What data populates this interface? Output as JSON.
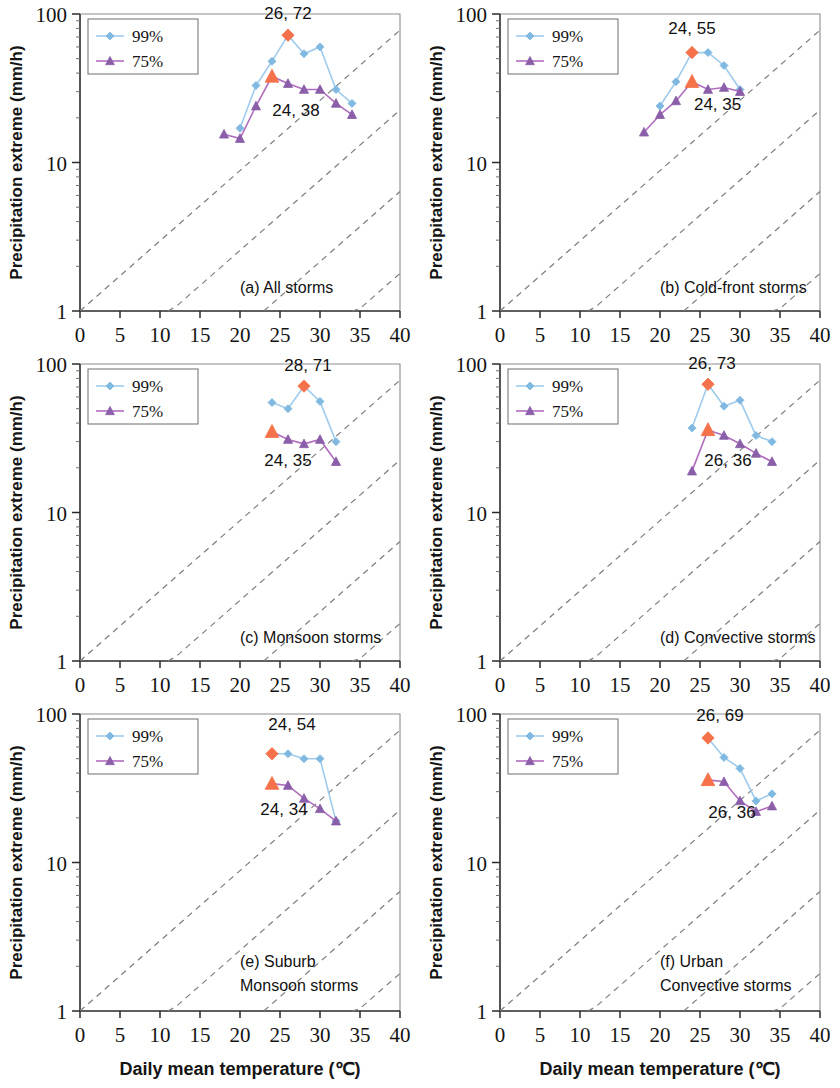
{
  "figure": {
    "n_panels": 6,
    "shared_xlabel": "Daily mean temperature (℃)",
    "shared_ylabel": "Precipitation extreme (mm/h)",
    "legend_labels": [
      "99%",
      "75%"
    ],
    "colors": {
      "series_99": "#7fb8e0",
      "series_99_line": "#9ecbec",
      "series_75": "#8a5ea8",
      "series_75_line": "#b06cbe",
      "highlight": "#f4714a",
      "cc_dashed": "#7d7d7d",
      "axis": "#2b2b2b"
    },
    "x_ticks": [
      0,
      5,
      10,
      15,
      20,
      25,
      30,
      35,
      40
    ],
    "y_ticks": [
      1,
      10,
      100
    ],
    "xlim": [
      0,
      40
    ],
    "ylim": [
      1,
      100
    ],
    "yscale": "log"
  },
  "chart_data": [
    {
      "id": "a",
      "type": "line",
      "title": "(a) All storms",
      "caption_lines": [
        "(a) All storms"
      ],
      "xlabel": "Daily mean temperature (℃)",
      "ylabel": "Precipitation extreme (mm/h)",
      "xlim": [
        0,
        40
      ],
      "ylim": [
        1,
        100
      ],
      "yscale": "log",
      "grid": false,
      "legend_position": "top-left",
      "series": [
        {
          "name": "99%",
          "marker": "diamond",
          "color": "#7fb8e0",
          "x": [
            20,
            22,
            24,
            26,
            28,
            30,
            32,
            34
          ],
          "values": [
            17,
            33,
            48,
            72,
            54,
            60,
            31,
            25
          ]
        },
        {
          "name": "75%",
          "marker": "triangle",
          "color": "#8a5ea8",
          "x": [
            18,
            20,
            22,
            24,
            26,
            28,
            30,
            32,
            34
          ],
          "values": [
            15.5,
            14.5,
            24,
            38,
            34,
            31,
            31,
            25,
            21
          ]
        }
      ],
      "highlights": [
        {
          "series": "99%",
          "x": 26,
          "y": 72,
          "label": "26, 72",
          "label_x": 26,
          "label_y": 92
        },
        {
          "series": "75%",
          "x": 24,
          "y": 38,
          "label": "24, 38",
          "label_x": 27.0,
          "label_y": 20.5
        }
      ]
    },
    {
      "id": "b",
      "type": "line",
      "title": "(b) Cold-front storms",
      "caption_lines": [
        "(b) Cold-front storms"
      ],
      "xlabel": "Daily mean temperature (℃)",
      "ylabel": "Precipitation extreme (mm/h)",
      "xlim": [
        0,
        40
      ],
      "ylim": [
        1,
        100
      ],
      "yscale": "log",
      "grid": false,
      "legend_position": "top-left",
      "series": [
        {
          "name": "99%",
          "marker": "diamond",
          "color": "#7fb8e0",
          "x": [
            20,
            22,
            24,
            26,
            28,
            30
          ],
          "values": [
            24,
            35,
            55,
            55,
            45,
            31
          ]
        },
        {
          "name": "75%",
          "marker": "triangle",
          "color": "#8a5ea8",
          "x": [
            18,
            20,
            22,
            24,
            26,
            28,
            30
          ],
          "values": [
            16,
            21,
            26,
            35,
            31,
            32,
            30
          ]
        }
      ],
      "highlights": [
        {
          "series": "99%",
          "x": 24,
          "y": 55,
          "label": "24, 55",
          "label_x": 24,
          "label_y": 73
        },
        {
          "series": "75%",
          "x": 24,
          "y": 35,
          "label": "24, 35",
          "label_x": 27.2,
          "label_y": 22.5
        }
      ]
    },
    {
      "id": "c",
      "type": "line",
      "title": "(c) Monsoon storms",
      "caption_lines": [
        "(c) Monsoon storms"
      ],
      "xlabel": "Daily mean temperature (℃)",
      "ylabel": "Precipitation extreme (mm/h)",
      "xlim": [
        0,
        40
      ],
      "ylim": [
        1,
        100
      ],
      "yscale": "log",
      "grid": false,
      "legend_position": "top-left",
      "series": [
        {
          "name": "99%",
          "marker": "diamond",
          "color": "#7fb8e0",
          "x": [
            24,
            26,
            28,
            30,
            32
          ],
          "values": [
            55,
            50,
            71,
            56,
            30
          ]
        },
        {
          "name": "75%",
          "marker": "triangle",
          "color": "#8a5ea8",
          "x": [
            24,
            26,
            28,
            30,
            32
          ],
          "values": [
            35,
            31,
            29,
            31,
            22
          ]
        }
      ],
      "highlights": [
        {
          "series": "99%",
          "x": 28,
          "y": 71,
          "label": "28, 71",
          "label_x": 28.5,
          "label_y": 90
        },
        {
          "series": "75%",
          "x": 24,
          "y": 35,
          "label": "24, 35",
          "label_x": 26.0,
          "label_y": 20.5
        }
      ]
    },
    {
      "id": "d",
      "type": "line",
      "title": "(d) Convective storms",
      "caption_lines": [
        "(d) Convective storms"
      ],
      "xlabel": "Daily mean temperature (℃)",
      "ylabel": "Precipitation extreme (mm/h)",
      "xlim": [
        0,
        40
      ],
      "ylim": [
        1,
        100
      ],
      "yscale": "log",
      "grid": false,
      "legend_position": "top-left",
      "series": [
        {
          "name": "99%",
          "marker": "diamond",
          "color": "#7fb8e0",
          "x": [
            24,
            26,
            28,
            30,
            32,
            34
          ],
          "values": [
            37,
            73,
            52,
            57,
            33,
            30
          ]
        },
        {
          "name": "75%",
          "marker": "triangle",
          "color": "#8a5ea8",
          "x": [
            24,
            26,
            28,
            30,
            32,
            34
          ],
          "values": [
            19,
            36,
            33,
            29,
            25,
            22
          ]
        }
      ],
      "highlights": [
        {
          "series": "99%",
          "x": 26,
          "y": 73,
          "label": "26, 73",
          "label_x": 26.5,
          "label_y": 92
        },
        {
          "series": "75%",
          "x": 26,
          "y": 36,
          "label": "26, 36",
          "label_x": 28.5,
          "label_y": 20.5
        }
      ]
    },
    {
      "id": "e",
      "type": "line",
      "title": "(e) Suburb Monsoon storms",
      "caption_lines": [
        "(e) Suburb",
        "Monsoon storms"
      ],
      "xlabel": "Daily mean temperature (℃)",
      "ylabel": "Precipitation extreme (mm/h)",
      "xlim": [
        0,
        40
      ],
      "ylim": [
        1,
        100
      ],
      "yscale": "log",
      "grid": false,
      "legend_position": "top-left",
      "series": [
        {
          "name": "99%",
          "marker": "diamond",
          "color": "#7fb8e0",
          "x": [
            24,
            26,
            28,
            30,
            32
          ],
          "values": [
            54,
            54,
            50,
            50,
            19
          ]
        },
        {
          "name": "75%",
          "marker": "triangle",
          "color": "#8a5ea8",
          "x": [
            24,
            26,
            28,
            30,
            32
          ],
          "values": [
            34,
            33,
            27,
            23,
            19
          ]
        }
      ],
      "highlights": [
        {
          "series": "99%",
          "x": 24,
          "y": 54,
          "label": "24, 54",
          "label_x": 26.5,
          "label_y": 78
        },
        {
          "series": "75%",
          "x": 24,
          "y": 34,
          "label": "24, 34",
          "label_x": 25.5,
          "label_y": 21.0
        }
      ]
    },
    {
      "id": "f",
      "type": "line",
      "title": "(f) Urban Convective storms",
      "caption_lines": [
        "(f) Urban",
        "Convective storms"
      ],
      "xlabel": "Daily mean temperature (℃)",
      "ylabel": "Precipitation extreme (mm/h)",
      "xlim": [
        0,
        40
      ],
      "ylim": [
        1,
        100
      ],
      "yscale": "log",
      "grid": false,
      "legend_position": "top-left",
      "series": [
        {
          "name": "99%",
          "marker": "diamond",
          "color": "#7fb8e0",
          "x": [
            26,
            28,
            30,
            32,
            34
          ],
          "values": [
            69,
            51,
            43,
            26,
            29
          ]
        },
        {
          "name": "75%",
          "marker": "triangle",
          "color": "#8a5ea8",
          "x": [
            26,
            28,
            30,
            32,
            34
          ],
          "values": [
            36,
            35,
            26,
            22,
            24
          ]
        }
      ],
      "highlights": [
        {
          "series": "99%",
          "x": 26,
          "y": 69,
          "label": "26, 69",
          "label_x": 27.5,
          "label_y": 90
        },
        {
          "series": "75%",
          "x": 26,
          "y": 36,
          "label": "26, 36",
          "label_x": 29.0,
          "label_y": 20.0
        }
      ]
    }
  ]
}
